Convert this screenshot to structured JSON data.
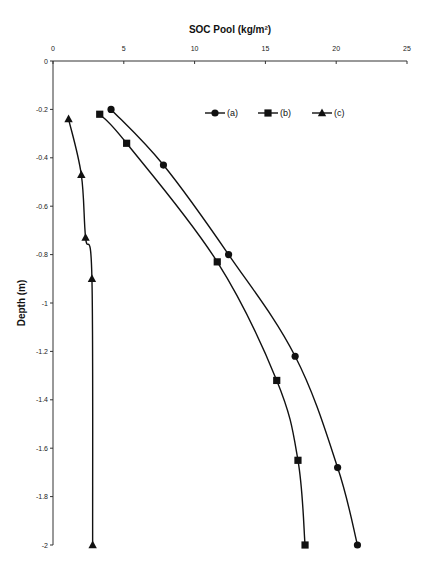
{
  "chart_data": {
    "type": "line",
    "title": "",
    "xlabel": "SOC Pool (kg/m²)",
    "ylabel": "Depth (m)",
    "xlim": [
      0,
      25
    ],
    "ylim": [
      -2,
      0
    ],
    "x_ticks": [
      0,
      5,
      10,
      15,
      20,
      25
    ],
    "x_tick_labels": [
      "0",
      "5",
      "10",
      "15",
      "20",
      "25"
    ],
    "y_ticks": [
      0,
      -0.2,
      -0.4,
      -0.6,
      -0.8,
      -1,
      -1.2,
      -1.4,
      -1.6,
      -1.8,
      -2
    ],
    "y_tick_labels": [
      "0",
      "-0.2",
      "-0.4",
      "-0.6",
      "-0.8",
      "-1",
      "-1.2",
      "-1.4",
      "-1.6",
      "-1.8",
      "-2"
    ],
    "x_axis_position": "top",
    "grid": false,
    "legend_position": "top-right",
    "series": [
      {
        "name": "(a)",
        "marker": "circle",
        "x": [
          4.1,
          7.8,
          12.4,
          17.1,
          20.1,
          21.5
        ],
        "y": [
          -0.2,
          -0.43,
          -0.8,
          -1.22,
          -1.68,
          -2.0
        ]
      },
      {
        "name": "(b)",
        "marker": "square",
        "x": [
          3.3,
          5.2,
          11.6,
          15.8,
          17.3,
          17.8
        ],
        "y": [
          -0.22,
          -0.34,
          -0.83,
          -1.32,
          -1.65,
          -2.0
        ]
      },
      {
        "name": "(c)",
        "marker": "triangle",
        "x": [
          1.1,
          2.0,
          2.3,
          2.75,
          2.8
        ],
        "y": [
          -0.24,
          -0.47,
          -0.73,
          -0.9,
          -2.0
        ]
      }
    ]
  }
}
